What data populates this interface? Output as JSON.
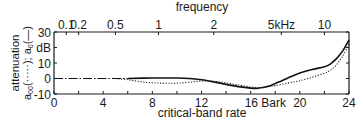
{
  "chart_data": {
    "type": "line",
    "title": "",
    "top_axis": {
      "label": "frequency",
      "unit_label": "kHz",
      "ticks": [
        {
          "label": "0.1",
          "bark": 1
        },
        {
          "label": "0.2",
          "bark": 2
        },
        {
          "label": "0.5",
          "bark": 5
        },
        {
          "label": "1",
          "bark": 8.5
        },
        {
          "label": "2",
          "bark": 13
        },
        {
          "label": "5kHz",
          "bark": 18.5
        },
        {
          "label": "10",
          "bark": 22
        }
      ]
    },
    "xlabel": "critical-band rate",
    "x_unit": "Bark",
    "xlim": [
      0,
      24
    ],
    "x_ticks": [
      0,
      4,
      8,
      12,
      16,
      20,
      24
    ],
    "x_tick_labels": [
      "0",
      "4",
      "8",
      "12",
      "16 Bark",
      "20",
      "24"
    ],
    "x_minor_ticks": [
      2,
      6,
      10,
      14,
      18,
      22
    ],
    "ylabel": "attenuation a00(-----); a0(—)",
    "y_unit": "dB",
    "ylim": [
      -10,
      30
    ],
    "y_ticks": [
      -10,
      0,
      10,
      20,
      30
    ],
    "y_tick_labels": [
      "-10",
      "0",
      "10",
      "dB",
      "30"
    ],
    "grid": false,
    "legend": "none (encoded in y-axis label)",
    "series": [
      {
        "name": "a0",
        "style": "solid",
        "x": [
          0,
          2,
          4,
          6,
          8,
          10,
          11,
          12,
          13,
          14,
          15,
          16,
          16.5,
          17,
          17.5,
          18,
          18.5,
          19,
          19.5,
          20,
          21,
          22,
          22.5,
          23,
          23.5,
          24
        ],
        "values": [
          0,
          0,
          0,
          0,
          0.3,
          0.3,
          0,
          -0.8,
          -2.2,
          -3.8,
          -5.2,
          -6.2,
          -6.4,
          -5.8,
          -4.8,
          -3.2,
          -1.6,
          0.2,
          2,
          3.6,
          5.8,
          7.6,
          9.5,
          13,
          18,
          25
        ]
      },
      {
        "name": "a00",
        "style": "dotted",
        "x": [
          0,
          2,
          4,
          5,
          6,
          7,
          8,
          9,
          10,
          11,
          12,
          13,
          14,
          15,
          16,
          16.5,
          17,
          17.5,
          18,
          19,
          20,
          21,
          22,
          22.5,
          23,
          23.5,
          24
        ],
        "values": [
          0,
          0,
          0,
          0,
          -0.8,
          -2,
          -2.8,
          -3,
          -3,
          -2.4,
          -1.6,
          -1.8,
          -2.8,
          -4.2,
          -5.4,
          -5.8,
          -5.8,
          -5.2,
          -4.6,
          -3,
          -1.4,
          0.8,
          3.4,
          5.5,
          9,
          14.5,
          22
        ]
      }
    ]
  }
}
